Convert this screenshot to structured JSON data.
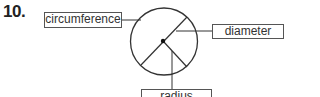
{
  "question": {
    "number": "10."
  },
  "diagram": {
    "labels": {
      "circumference": "circumference",
      "diameter": "diameter",
      "radius": "radius"
    },
    "colors": {
      "stroke": "#333333",
      "box_border": "#555555",
      "text": "#333333"
    }
  }
}
